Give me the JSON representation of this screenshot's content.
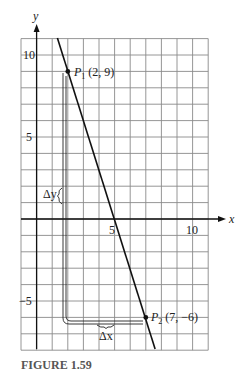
{
  "figure": {
    "caption": "FIGURE 1.59",
    "x_axis_label": "x",
    "y_axis_label": "y",
    "x_ticks": [
      {
        "value": 5,
        "label": "5"
      },
      {
        "value": 10,
        "label": "10"
      }
    ],
    "y_ticks": [
      {
        "value": 10,
        "label": "10"
      },
      {
        "value": 5,
        "label": "5"
      },
      {
        "value": -5,
        "label": "−5"
      }
    ],
    "grid": {
      "x_min": -1,
      "x_max": 11,
      "y_min": -8,
      "y_max": 11,
      "step": 1
    },
    "points": [
      {
        "name": "P",
        "subscript": "1",
        "coords": "(2, 9)",
        "x": 2,
        "y": 9
      },
      {
        "name": "P",
        "subscript": "2",
        "coords": "(7, −6)",
        "x": 7,
        "y": -6
      }
    ],
    "line": {
      "slope": -3,
      "through": [
        [
          2,
          9
        ],
        [
          7,
          -6
        ]
      ]
    },
    "annotations": {
      "delta_y": "Δy",
      "delta_x": "Δx"
    },
    "colors": {
      "line": "#111111",
      "grid": "#8a8a8a",
      "caption": "#555555"
    }
  }
}
